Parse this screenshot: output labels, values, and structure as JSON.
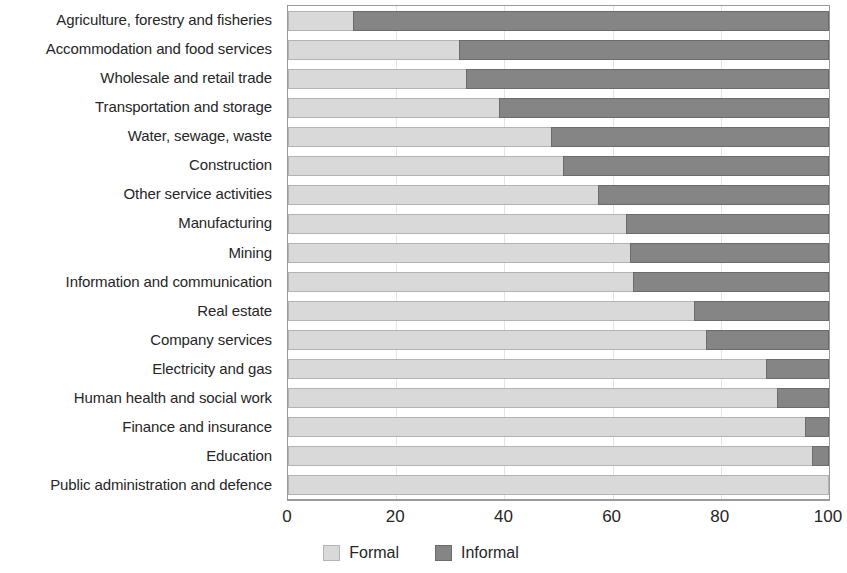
{
  "chart_data": {
    "type": "bar",
    "orientation": "horizontal",
    "stacked": true,
    "stacked_percent": true,
    "title": "",
    "subtitle": "",
    "xlabel": "",
    "ylabel": "",
    "xlim": [
      0,
      100
    ],
    "xticks": [
      0,
      20,
      40,
      60,
      80,
      100
    ],
    "xtick_labels": [
      "0",
      "20",
      "40",
      "60",
      "80",
      "100"
    ],
    "grid": true,
    "grid_axis": "x",
    "legend_position": "bottom",
    "categories": [
      "Agriculture, forestry and fisheries",
      "Accommodation and food services",
      "Wholesale and retail trade",
      "Transportation and storage",
      "Water, sewage, waste",
      "Construction",
      "Other service activities",
      "Manufacturing",
      "Mining",
      "Information and communication",
      "Real estate",
      "Company services",
      "Electricity and gas",
      "Human health and social work",
      "Finance and insurance",
      "Education",
      "Public administration and defence"
    ],
    "series": [
      {
        "name": "Formal",
        "color": "#d9d9d9",
        "values": [
          12,
          31.6,
          32.9,
          39,
          48.6,
          50.8,
          57.3,
          62.5,
          63.2,
          63.8,
          75,
          77.3,
          88.4,
          90.4,
          95.6,
          96.9,
          100
        ]
      },
      {
        "name": "Informal",
        "color": "#858585",
        "values": [
          88,
          68.4,
          67.1,
          61,
          51.4,
          49.2,
          42.7,
          37.5,
          36.8,
          36.2,
          25,
          22.7,
          11.6,
          9.6,
          4.4,
          3.1,
          0
        ]
      }
    ]
  },
  "legend": {
    "items": [
      {
        "label": "Formal",
        "swatch": "formal-swatch"
      },
      {
        "label": "Informal",
        "swatch": "informal-swatch"
      }
    ]
  }
}
